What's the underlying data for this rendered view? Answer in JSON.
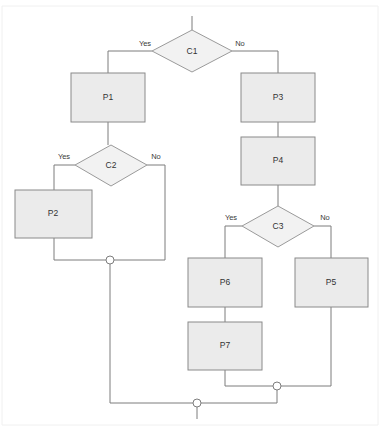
{
  "diagram": {
    "canvas": {
      "width": 382,
      "height": 431,
      "background": "#ffffff"
    },
    "style": {
      "process_fill": "#ebebeb",
      "process_stroke": "#8a8a8a",
      "decision_fill": "#f2f2f2",
      "decision_stroke": "#9a9a9a",
      "connector_stroke": "#7d7d7d",
      "junction_fill": "#ffffff",
      "text_color": "#333333"
    },
    "nodes": {
      "c1": {
        "label": "C1",
        "type": "decision",
        "cx": 192,
        "cy": 51,
        "rx": 40,
        "ry": 21
      },
      "c2": {
        "label": "C2",
        "type": "decision",
        "cx": 111,
        "cy": 165,
        "rx": 36,
        "ry": 20
      },
      "c3": {
        "label": "C3",
        "type": "decision",
        "cx": 278,
        "cy": 226,
        "rx": 36,
        "ry": 20
      },
      "p1": {
        "label": "P1",
        "type": "process",
        "x": 71,
        "y": 73,
        "w": 74,
        "h": 49
      },
      "p2": {
        "label": "P2",
        "type": "process",
        "x": 15,
        "y": 190,
        "w": 77,
        "h": 48
      },
      "p3": {
        "label": "P3",
        "type": "process",
        "x": 241,
        "y": 73,
        "w": 74,
        "h": 49
      },
      "p4": {
        "label": "P4",
        "type": "process",
        "x": 241,
        "y": 137,
        "w": 74,
        "h": 48
      },
      "p5": {
        "label": "P5",
        "type": "process",
        "x": 295,
        "y": 258,
        "w": 73,
        "h": 49
      },
      "p6": {
        "label": "P6",
        "type": "process",
        "x": 188,
        "y": 258,
        "w": 74,
        "h": 49
      },
      "p7": {
        "label": "P7",
        "type": "process",
        "x": 188,
        "y": 322,
        "w": 74,
        "h": 48
      }
    },
    "edge_labels": {
      "c1_yes": "Yes",
      "c1_no": "No",
      "c2_yes": "Yes",
      "c2_no": "No",
      "c3_yes": "Yes",
      "c3_no": "No"
    },
    "junctions": [
      {
        "name": "merge-left",
        "cx": 110,
        "cy": 260,
        "r": 4
      },
      {
        "name": "merge-right",
        "cx": 277,
        "cy": 386,
        "r": 4
      },
      {
        "name": "merge-final",
        "cx": 197,
        "cy": 403,
        "r": 4
      }
    ],
    "edges": [
      {
        "from": "start",
        "to": "c1",
        "label": ""
      },
      {
        "from": "c1",
        "to": "p1",
        "label": "Yes"
      },
      {
        "from": "c1",
        "to": "p3",
        "label": "No"
      },
      {
        "from": "p1",
        "to": "c2",
        "label": ""
      },
      {
        "from": "c2",
        "to": "p2",
        "label": "Yes"
      },
      {
        "from": "c2",
        "to": "merge-left",
        "label": "No"
      },
      {
        "from": "p2",
        "to": "merge-left",
        "label": ""
      },
      {
        "from": "p3",
        "to": "p4",
        "label": ""
      },
      {
        "from": "p4",
        "to": "c3",
        "label": ""
      },
      {
        "from": "c3",
        "to": "p6",
        "label": "Yes"
      },
      {
        "from": "c3",
        "to": "p5",
        "label": "No"
      },
      {
        "from": "p6",
        "to": "p7",
        "label": ""
      },
      {
        "from": "p7",
        "to": "merge-right",
        "label": ""
      },
      {
        "from": "p5",
        "to": "merge-right",
        "label": ""
      },
      {
        "from": "merge-left",
        "to": "merge-final",
        "label": ""
      },
      {
        "from": "merge-right",
        "to": "merge-final",
        "label": ""
      },
      {
        "from": "merge-final",
        "to": "end",
        "label": ""
      }
    ]
  }
}
